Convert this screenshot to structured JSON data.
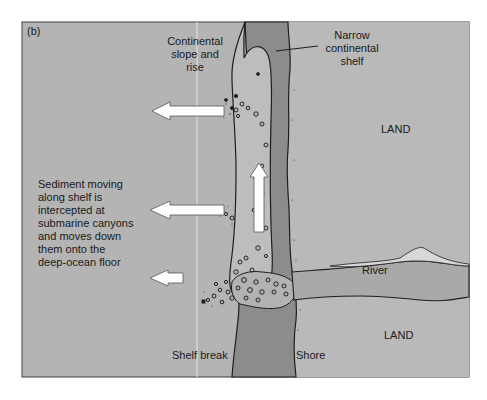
{
  "figure": {
    "panel_label": "(b)",
    "colors": {
      "background": "#ffffff",
      "ocean": "#b4b4b4",
      "land": "#b8b8b8",
      "shelf_dark": "#8c8c8c",
      "canyon_light": "#c4c4c4",
      "river": "#a8a8a8",
      "outline": "#1e1e1e",
      "arrow_fill": "#ffffff"
    }
  },
  "labels": {
    "continental_slope": [
      "Continental",
      "slope and",
      "rise"
    ],
    "narrow_shelf": [
      "Narrow",
      "continental",
      "shelf"
    ],
    "land_top": "LAND",
    "land_bottom": "LAND",
    "river": "River",
    "shelf_break": "Shelf break",
    "shore": "Shore",
    "sediment_caption": [
      "Sediment moving",
      "along shelf is",
      "intercepted at",
      "submarine canyons",
      "and moves down",
      "them onto the",
      "deep-ocean floor"
    ]
  },
  "arrows": [
    {
      "name": "upper-left-arrow",
      "direction": "left"
    },
    {
      "name": "middle-left-arrow",
      "direction": "left"
    },
    {
      "name": "lower-left-arrow",
      "direction": "left"
    },
    {
      "name": "along-shelf-arrow",
      "direction": "up"
    }
  ]
}
